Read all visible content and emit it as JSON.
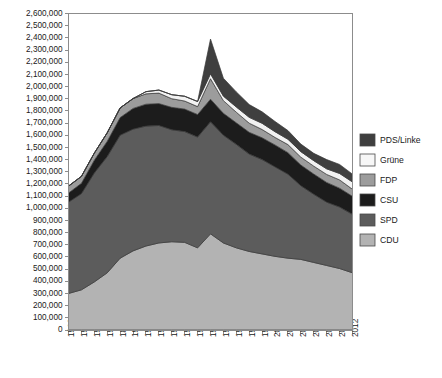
{
  "chart_data": {
    "type": "area",
    "title": "",
    "subtitle": "",
    "xlabel": "",
    "ylabel": "",
    "stacked": true,
    "grid": false,
    "legend_position": "right",
    "xlim": [
      1968,
      2012
    ],
    "ylim": [
      0,
      2600000
    ],
    "ytick_step": 100000,
    "x": [
      1968,
      1970,
      1972,
      1974,
      1976,
      1978,
      1980,
      1982,
      1984,
      1986,
      1988,
      1990,
      1992,
      1994,
      1996,
      1998,
      2000,
      2002,
      2004,
      2006,
      2008,
      2010,
      2012
    ],
    "xtick_labels": [
      "1968",
      "1970",
      "1972",
      "1974",
      "1876",
      "1978",
      "1980",
      "1982",
      "1984",
      "1986",
      "1988",
      "1990",
      "1992",
      "1994",
      "1996",
      "1998",
      "2000",
      "2002",
      "2004",
      "2006",
      "2008",
      "2010",
      "2012"
    ],
    "ytick_labels": [
      "0",
      "100,000",
      "200,000",
      "300,000",
      "400,000",
      "500,000",
      "600,000",
      "700,000",
      "800,000",
      "900,000",
      "1,000,000",
      "1,100,000",
      "1,200,000",
      "1,300,000",
      "1,400,000",
      "1,500,000",
      "1,600,000",
      "1,700,000",
      "1,800,000",
      "1,900,000",
      "2,000,000",
      "2,100,000",
      "2,200,000",
      "2,300,000",
      "2,400,000",
      "2,500,000",
      "2,600,000"
    ],
    "stack_order_bottom_to_top": [
      "CDU",
      "SPD",
      "CSU",
      "FDP",
      "Grüne",
      "PDS/Linke"
    ],
    "series": [
      {
        "name": "CDU",
        "color": "#b3b3b3",
        "values": [
          300000,
          330000,
          395000,
          470000,
          590000,
          650000,
          690000,
          715000,
          725000,
          720000,
          675000,
          790000,
          715000,
          675000,
          645000,
          625000,
          605000,
          590000,
          580000,
          555000,
          530000,
          505000,
          470000
        ]
      },
      {
        "name": "SPD",
        "color": "#5c5c5c",
        "values": [
          750000,
          790000,
          895000,
          955000,
          1010000,
          1000000,
          985000,
          965000,
          920000,
          910000,
          910000,
          920000,
          885000,
          850000,
          800000,
          775000,
          735000,
          690000,
          605000,
          560000,
          520000,
          505000,
          480000
        ]
      },
      {
        "name": "CSU",
        "color": "#1c1c1c",
        "values": [
          75000,
          85000,
          105000,
          125000,
          145000,
          170000,
          180000,
          180000,
          184000,
          185000,
          185000,
          186000,
          180000,
          177000,
          179000,
          179000,
          180000,
          177000,
          170000,
          166000,
          162000,
          155000,
          148000
        ]
      },
      {
        "name": "FDP",
        "color": "#9c9c9c",
        "values": [
          57000,
          57000,
          58000,
          70000,
          79000,
          81000,
          85000,
          86000,
          71000,
          66000,
          65000,
          168000,
          104000,
          87000,
          75000,
          68000,
          62000,
          66000,
          65000,
          65000,
          66000,
          68000,
          58000
        ]
      },
      {
        "name": "Grüne",
        "color": "#f2f2f2",
        "values": [
          0,
          0,
          0,
          0,
          0,
          0,
          18000,
          25000,
          33000,
          39000,
          42000,
          41000,
          37000,
          43000,
          48000,
          51000,
          47000,
          44000,
          45000,
          45000,
          46000,
          53000,
          60000
        ]
      },
      {
        "name": "PDS/Linke",
        "color": "#3f3f3f",
        "values": [
          0,
          0,
          0,
          0,
          0,
          0,
          0,
          0,
          0,
          0,
          0,
          285000,
          147000,
          124000,
          105000,
          94000,
          84000,
          71000,
          62000,
          60000,
          76000,
          74000,
          64000
        ]
      }
    ]
  },
  "legend": {
    "items": [
      {
        "label": "PDS/Linke",
        "color": "#3f3f3f"
      },
      {
        "label": "Grüne",
        "color": "#f7f7f7"
      },
      {
        "label": "FDP",
        "color": "#9c9c9c"
      },
      {
        "label": "CSU",
        "color": "#1c1c1c"
      },
      {
        "label": "SPD",
        "color": "#5c5c5c"
      },
      {
        "label": "CDU",
        "color": "#b3b3b3"
      }
    ]
  }
}
